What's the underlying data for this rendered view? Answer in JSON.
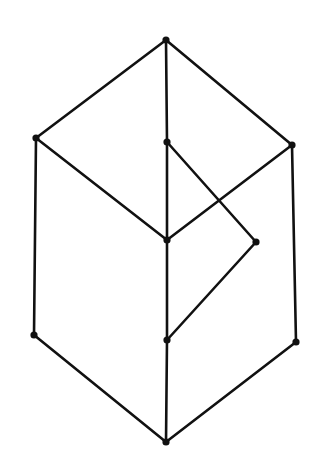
{
  "diagram": {
    "type": "hasse-diagram",
    "background": "#ffffff",
    "stroke_color": "#111111",
    "node_color": "#111111",
    "stroke_width": 2.6,
    "node_radius": 3.6,
    "nodes": [
      {
        "id": "top",
        "x": 166,
        "y": 40
      },
      {
        "id": "left-upper",
        "x": 36,
        "y": 138
      },
      {
        "id": "center-upper",
        "x": 167,
        "y": 142
      },
      {
        "id": "right-upper",
        "x": 292,
        "y": 145
      },
      {
        "id": "center-middle",
        "x": 167,
        "y": 240
      },
      {
        "id": "right-middle",
        "x": 256,
        "y": 242
      },
      {
        "id": "left-lower",
        "x": 34,
        "y": 335
      },
      {
        "id": "center-lower",
        "x": 167,
        "y": 340
      },
      {
        "id": "right-lower",
        "x": 296,
        "y": 342
      },
      {
        "id": "bottom",
        "x": 166,
        "y": 442
      }
    ],
    "edges": [
      [
        "top",
        "left-upper"
      ],
      [
        "top",
        "center-upper"
      ],
      [
        "top",
        "right-upper"
      ],
      [
        "left-upper",
        "center-middle"
      ],
      [
        "left-upper",
        "left-lower"
      ],
      [
        "center-upper",
        "center-middle"
      ],
      [
        "center-upper",
        "right-middle"
      ],
      [
        "right-upper",
        "center-middle"
      ],
      [
        "right-upper",
        "right-lower"
      ],
      [
        "center-middle",
        "center-lower"
      ],
      [
        "right-middle",
        "center-lower"
      ],
      [
        "left-lower",
        "bottom"
      ],
      [
        "center-lower",
        "bottom"
      ],
      [
        "right-lower",
        "bottom"
      ]
    ]
  }
}
